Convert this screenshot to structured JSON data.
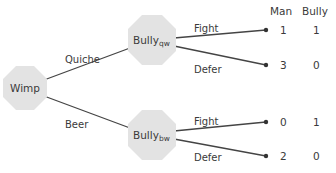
{
  "diagram": {
    "type": "game-tree",
    "header": {
      "man": "Man",
      "bully": "Bully"
    },
    "root": {
      "label": "Wimp"
    },
    "bully_nodes": [
      {
        "label": "Bully",
        "subscript": "qw",
        "move_label": "Quiche"
      },
      {
        "label": "Bully",
        "subscript": "bw",
        "move_label": "Beer"
      }
    ],
    "actions": [
      {
        "parent": 0,
        "label": "Fight",
        "payoff_man": "1",
        "payoff_bully": "1"
      },
      {
        "parent": 0,
        "label": "Defer",
        "payoff_man": "3",
        "payoff_bully": "0"
      },
      {
        "parent": 1,
        "label": "Fight",
        "payoff_man": "0",
        "payoff_bully": "1"
      },
      {
        "parent": 1,
        "label": "Defer",
        "payoff_man": "2",
        "payoff_bully": "0"
      }
    ],
    "colors": {
      "node_fill": "#e3e3e3",
      "edge": "#444444",
      "text": "#3a3a3a"
    }
  }
}
